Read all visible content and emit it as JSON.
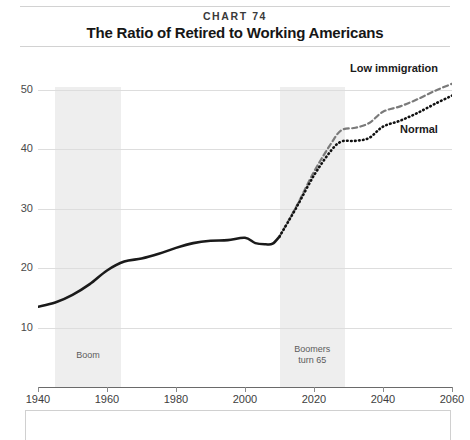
{
  "header": {
    "chart_number": "CHART 74",
    "title": "The Ratio of Retired to Working Americans"
  },
  "chart_data": {
    "type": "line",
    "title": "The Ratio of Retired to Working Americans",
    "subtitle": "CHART 74",
    "xlabel": "",
    "ylabel": "",
    "xlim": [
      1940,
      2060
    ],
    "ylim": [
      0,
      55
    ],
    "grid": true,
    "legend_position": "inline-right",
    "x_ticks": [
      1940,
      1960,
      1980,
      2000,
      2020,
      2040,
      2060
    ],
    "y_ticks": [
      10,
      20,
      30,
      40,
      50
    ],
    "annotations": [
      {
        "name": "boom",
        "label": "Boom",
        "x_start": 1945,
        "x_end": 1964
      },
      {
        "name": "boomers-turn-65",
        "label": "Boomers\nturn 65",
        "x_start": 2010,
        "x_end": 2029
      }
    ],
    "series": [
      {
        "name": "Historical",
        "style": "solid",
        "color": "#1a1a1a",
        "x": [
          1940,
          1945,
          1950,
          1955,
          1960,
          1965,
          1970,
          1975,
          1980,
          1985,
          1990,
          1995,
          2000,
          2003,
          2006,
          2008,
          2010
        ],
        "values": [
          13.5,
          14.2,
          15.5,
          17.3,
          19.6,
          21.1,
          21.6,
          22.4,
          23.4,
          24.2,
          24.6,
          24.7,
          25.1,
          24.2,
          24.0,
          24.1,
          25.3
        ]
      },
      {
        "name": "Low immigration",
        "style": "dashed",
        "color": "#7a7a7a",
        "x": [
          2010,
          2015,
          2020,
          2025,
          2028,
          2032,
          2036,
          2040,
          2045,
          2050,
          2055,
          2060
        ],
        "values": [
          25.3,
          30.5,
          36.2,
          41.0,
          43.2,
          43.6,
          44.4,
          46.3,
          47.2,
          48.4,
          49.8,
          51.0
        ]
      },
      {
        "name": "Normal",
        "style": "dotted",
        "color": "#111111",
        "x": [
          2010,
          2015,
          2020,
          2025,
          2028,
          2032,
          2036,
          2040,
          2045,
          2050,
          2055,
          2060
        ],
        "values": [
          25.3,
          30.3,
          35.6,
          39.8,
          41.3,
          41.4,
          41.9,
          43.8,
          44.8,
          46.1,
          47.6,
          49.0
        ]
      }
    ],
    "series_labels": [
      {
        "name": "low-immigration",
        "text": "Low immigration"
      },
      {
        "name": "normal",
        "text": "Normal"
      }
    ]
  }
}
